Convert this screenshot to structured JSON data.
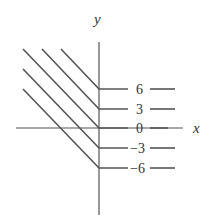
{
  "axes": {
    "x_label": "x",
    "y_label": "y"
  },
  "level_curves": [
    {
      "label": "6",
      "y": 89,
      "start_x": 61,
      "start_y": 49
    },
    {
      "label": "3",
      "y": 109,
      "start_x": 42,
      "start_y": 49
    },
    {
      "label": "0",
      "y": 128,
      "start_x": 23,
      "start_y": 49
    },
    {
      "label": "−3",
      "y": 148,
      "start_x": 23,
      "start_y": 69
    },
    {
      "label": "−6",
      "y": 168,
      "start_x": 23,
      "start_y": 89
    }
  ],
  "colors": {
    "line": "#555555",
    "text": "#333333"
  }
}
